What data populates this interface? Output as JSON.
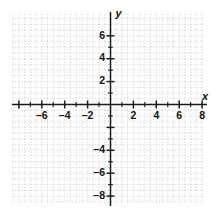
{
  "chart_data": {
    "type": "scatter",
    "title": "",
    "subtitle": "",
    "xlabel": "x",
    "ylabel": "y",
    "xlim": [
      -8.6,
      8.1
    ],
    "ylim": [
      -8.6,
      7.0
    ],
    "grid": true,
    "grid_style": "dotted",
    "grid_step": 0.5,
    "legend": null,
    "series": [],
    "x": [],
    "values": [],
    "annotations": [],
    "x_axis": {
      "name": "x",
      "major_tick_step": 2,
      "minor_tick_step": 1,
      "tick_values": [
        -8,
        -7,
        -6,
        -5,
        -4,
        -3,
        -2,
        -1,
        0,
        1,
        2,
        3,
        4,
        5,
        6,
        7,
        8
      ],
      "labeled_ticks": [
        {
          "value": -6,
          "label": "–6"
        },
        {
          "value": -4,
          "label": "–4"
        },
        {
          "value": -2,
          "label": "–2"
        },
        {
          "value": 2,
          "label": "2"
        },
        {
          "value": 4,
          "label": "4"
        },
        {
          "value": 6,
          "label": "6"
        },
        {
          "value": 8,
          "label": "8"
        }
      ]
    },
    "y_axis": {
      "name": "y",
      "major_tick_step": 2,
      "minor_tick_step": 1,
      "tick_values": [
        -8,
        -7,
        -6,
        -5,
        -4,
        -3,
        -2,
        -1,
        0,
        1,
        2,
        3,
        4,
        5,
        6
      ],
      "labeled_ticks": [
        {
          "value": 6,
          "label": "6"
        },
        {
          "value": 4,
          "label": "4"
        },
        {
          "value": 2,
          "label": "2"
        },
        {
          "value": -4,
          "label": "–4"
        },
        {
          "value": -6,
          "label": "–6"
        },
        {
          "value": -8,
          "label": "–8"
        }
      ]
    },
    "colors": {
      "axis": "#1a1a1a",
      "grid": "#b9b9b9",
      "text": "#141414",
      "background": "#ffffff"
    }
  }
}
